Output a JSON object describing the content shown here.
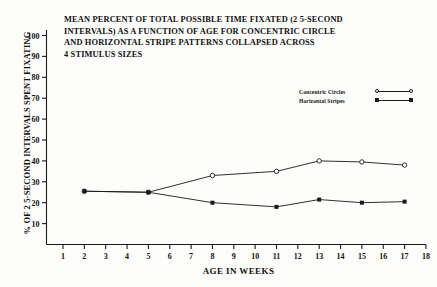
{
  "chart_data": {
    "type": "line",
    "title": "MEAN PERCENT OF TOTAL POSSIBLE TIME FIXATED (2 5-SECOND INTERVALS) AS A FUNCTION OF AGE FOR CONCENTRIC CIRCLE AND HORIZONTAL STRIPE PATTERNS COLLAPSED ACROSS 4 STIMULUS SIZES",
    "title_lines": [
      "MEAN PERCENT OF TOTAL POSSIBLE TIME FIXATED (2 5-SECOND",
      "INTERVALS) AS A FUNCTION OF AGE FOR CONCENTRIC CIRCLE",
      "AND HORIZONTAL STRIPE PATTERNS COLLAPSED ACROSS",
      "4 STIMULUS SIZES"
    ],
    "xlabel": "AGE IN WEEKS",
    "ylabel": "% OF 2 5-SECOND INTERVALS SPENT FIXATING",
    "xlim": [
      0,
      18
    ],
    "ylim": [
      0,
      105
    ],
    "xticks": [
      1,
      2,
      3,
      4,
      5,
      6,
      7,
      8,
      9,
      10,
      11,
      12,
      13,
      14,
      15,
      16,
      17,
      18
    ],
    "xticklabels": [
      "1",
      "2",
      "3",
      "4",
      "5",
      "6",
      "7",
      "8",
      "9",
      "10",
      "11",
      "12",
      "13",
      "14",
      "15",
      "16",
      "17",
      "18"
    ],
    "yticks": [
      10,
      20,
      30,
      40,
      50,
      60,
      70,
      80,
      90,
      100
    ],
    "yticklabels": [
      "10",
      "20",
      "30",
      "40",
      "50",
      "60",
      "70",
      "80",
      "90",
      "100"
    ],
    "grid": false,
    "legend_position": "upper right inside",
    "x": [
      2,
      5,
      8,
      11,
      13,
      15,
      17
    ],
    "series": [
      {
        "name": "Concentric Circles",
        "marker": "open-circle",
        "color": "#1a1a1a",
        "values": [
          25.5,
          25,
          33,
          35,
          40,
          39.5,
          38
        ]
      },
      {
        "name": "Horizontal Stripes",
        "marker": "filled-square",
        "color": "#1a1a1a",
        "values": [
          25.5,
          25,
          20,
          18,
          21.5,
          20,
          20.5
        ]
      }
    ]
  }
}
